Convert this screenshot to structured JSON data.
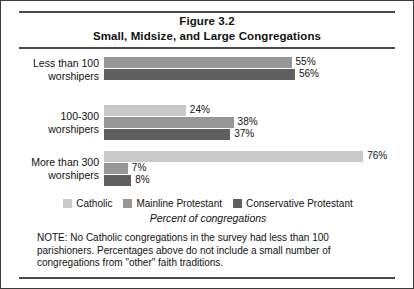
{
  "figure": {
    "title_line1": "Figure 3.2",
    "title_line2": "Small, Midsize, and Large Congregations",
    "axis_title": "Percent of congregations",
    "note": "NOTE: No Catholic congregations in the survey had less than 100 parishioners. Percentages above do not include a small number of congregations from \"other\" faith traditions."
  },
  "legend": {
    "items": [
      {
        "label": "Catholic",
        "color": "#c9c9c9",
        "swatch_name": "legend-swatch-catholic"
      },
      {
        "label": "Mainline Protestant",
        "color": "#969696",
        "swatch_name": "legend-swatch-mainline"
      },
      {
        "label": "Conservative Protestant",
        "color": "#5f5f5f",
        "swatch_name": "legend-swatch-conservative"
      }
    ]
  },
  "groups": [
    {
      "label_line1": "Less than 100",
      "label_line2": "worshipers",
      "bars": [
        {
          "series": "Mainline Protestant",
          "value": 55,
          "value_label": "55%"
        },
        {
          "series": "Conservative Protestant",
          "value": 56,
          "value_label": "56%"
        }
      ]
    },
    {
      "label_line1": "100-300",
      "label_line2": "worshipers",
      "bars": [
        {
          "series": "Catholic",
          "value": 24,
          "value_label": "24%"
        },
        {
          "series": "Mainline Protestant",
          "value": 38,
          "value_label": "38%"
        },
        {
          "series": "Conservative Protestant",
          "value": 37,
          "value_label": "37%"
        }
      ]
    },
    {
      "label_line1": "More than 300",
      "label_line2": "worshipers",
      "bars": [
        {
          "series": "Catholic",
          "value": 76,
          "value_label": "76%"
        },
        {
          "series": "Mainline Protestant",
          "value": 7,
          "value_label": "7%"
        },
        {
          "series": "Conservative Protestant",
          "value": 8,
          "value_label": "8%"
        }
      ]
    }
  ],
  "chart_data": {
    "type": "bar",
    "orientation": "horizontal",
    "xlabel": "Percent of congregations",
    "ylabel": "",
    "xlim": [
      0,
      80
    ],
    "grid": false,
    "legend_position": "bottom",
    "categories": [
      "Less than 100 worshipers",
      "100-300 worshipers",
      "More than 300 worshipers"
    ],
    "series": [
      {
        "name": "Catholic",
        "color": "#c9c9c9",
        "values": [
          null,
          24,
          76
        ]
      },
      {
        "name": "Mainline Protestant",
        "color": "#969696",
        "values": [
          55,
          38,
          7
        ]
      },
      {
        "name": "Conservative Protestant",
        "color": "#5f5f5f",
        "values": [
          56,
          37,
          8
        ]
      }
    ],
    "data_labels": [
      [
        "",
        "55%",
        "56%"
      ],
      [
        "24%",
        "38%",
        "37%"
      ],
      [
        "76%",
        "7%",
        "8%"
      ]
    ],
    "annotations": [
      "NOTE: No Catholic congregations in the survey had less than 100 parishioners. Percentages above do not include a small number of congregations from \"other\" faith traditions."
    ]
  }
}
